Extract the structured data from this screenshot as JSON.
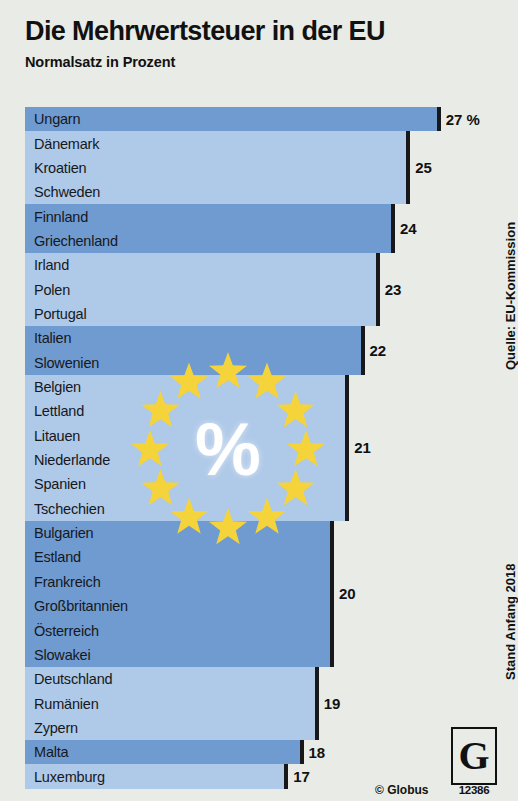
{
  "header": {
    "title": "Die Mehrwertsteuer in der EU",
    "subtitle": "Normalsatz in Prozent"
  },
  "side_notes": {
    "source": "Quelle: EU-Kommission",
    "date": "Stand Anfang 2018"
  },
  "emblem": {
    "symbol": "%",
    "star_count": 12,
    "star_color": "#f5d33a"
  },
  "footer": {
    "copyright": "© Globus",
    "logo_letter": "G",
    "graphic_number": "12386"
  },
  "colors": {
    "background": "#e8ebe6",
    "bar_dark": "#6f9bd1",
    "bar_light": "#afc9e8",
    "tick": "#18181a",
    "text": "#16181c"
  },
  "chart_data": {
    "type": "bar",
    "title": "Die Mehrwertsteuer in der EU",
    "subtitle": "Normalsatz in Prozent",
    "xlabel": "",
    "ylabel": "",
    "orientation": "horizontal",
    "unit": "%",
    "xlim": [
      0,
      27
    ],
    "grid": false,
    "legend": "none",
    "value_suffix_first": "27 %",
    "categories": [
      "Ungarn",
      "Dänemark",
      "Kroatien",
      "Schweden",
      "Finnland",
      "Griechenland",
      "Irland",
      "Polen",
      "Portugal",
      "Italien",
      "Slowenien",
      "Belgien",
      "Lettland",
      "Litauen",
      "Niederlande",
      "Spanien",
      "Tschechien",
      "Bulgarien",
      "Estland",
      "Frankreich",
      "Großbritannien",
      "Österreich",
      "Slowakei",
      "Deutschland",
      "Rumänien",
      "Zypern",
      "Malta",
      "Luxemburg"
    ],
    "values": [
      27,
      25,
      25,
      25,
      24,
      24,
      23,
      23,
      23,
      22,
      22,
      21,
      21,
      21,
      21,
      21,
      21,
      20,
      20,
      20,
      20,
      20,
      20,
      19,
      19,
      19,
      18,
      17
    ],
    "groups": [
      {
        "value": 27,
        "label": "27 %",
        "shade": "dark",
        "countries": [
          "Ungarn"
        ]
      },
      {
        "value": 25,
        "label": "25",
        "shade": "light",
        "countries": [
          "Dänemark",
          "Kroatien",
          "Schweden"
        ]
      },
      {
        "value": 24,
        "label": "24",
        "shade": "dark",
        "countries": [
          "Finnland",
          "Griechenland"
        ]
      },
      {
        "value": 23,
        "label": "23",
        "shade": "light",
        "countries": [
          "Irland",
          "Polen",
          "Portugal"
        ]
      },
      {
        "value": 22,
        "label": "22",
        "shade": "dark",
        "countries": [
          "Italien",
          "Slowenien"
        ]
      },
      {
        "value": 21,
        "label": "21",
        "shade": "light",
        "countries": [
          "Belgien",
          "Lettland",
          "Litauen",
          "Niederlande",
          "Spanien",
          "Tschechien"
        ]
      },
      {
        "value": 20,
        "label": "20",
        "shade": "dark",
        "countries": [
          "Bulgarien",
          "Estland",
          "Frankreich",
          "Großbritannien",
          "Österreich",
          "Slowakei"
        ]
      },
      {
        "value": 19,
        "label": "19",
        "shade": "light",
        "countries": [
          "Deutschland",
          "Rumänien",
          "Zypern"
        ]
      },
      {
        "value": 18,
        "label": "18",
        "shade": "dark",
        "countries": [
          "Malta"
        ]
      },
      {
        "value": 17,
        "label": "17",
        "shade": "light",
        "countries": [
          "Luxemburg"
        ]
      }
    ]
  }
}
